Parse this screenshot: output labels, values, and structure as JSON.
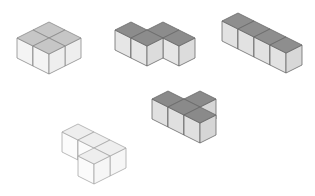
{
  "diagram": {
    "title": "",
    "width": 315,
    "height": 196,
    "background": "#ffffff",
    "geometry": {
      "axis_a": [
        16,
        8
      ],
      "axis_b": [
        16,
        -8
      ],
      "cube_height": 20
    },
    "shapes": [
      {
        "name": "square-2x2-block",
        "origin": [
          17,
          38
        ],
        "cells": [
          [
            0,
            0
          ],
          [
            1,
            0
          ],
          [
            0,
            1
          ],
          [
            1,
            1
          ]
        ],
        "top_color": "#c6c6c6",
        "left_color": "#f4f4f4",
        "right_color": "#eeeeee",
        "line_color": "#8a8a8a"
      },
      {
        "name": "s-tetromino",
        "origin": [
          115,
          30
        ],
        "cells": [
          [
            0,
            0
          ],
          [
            1,
            0
          ],
          [
            1,
            1
          ],
          [
            2,
            1
          ]
        ],
        "top_color": "#8c8c8c",
        "left_color": "#e6e6e6",
        "right_color": "#dcdcdc",
        "line_color": "#6a6a6a"
      },
      {
        "name": "i-tetromino-bar",
        "origin": [
          222,
          21
        ],
        "cells": [
          [
            0,
            0
          ],
          [
            1,
            0
          ],
          [
            2,
            0
          ],
          [
            3,
            0
          ]
        ],
        "top_color": "#8e8e8e",
        "left_color": "#e2e2e2",
        "right_color": "#d8d8d8",
        "line_color": "#6a6a6a"
      },
      {
        "name": "t-tetromino",
        "origin": [
          152,
          99
        ],
        "cells": [
          [
            0,
            0
          ],
          [
            1,
            0
          ],
          [
            2,
            0
          ],
          [
            1,
            1
          ]
        ],
        "top_color": "#8a8a8a",
        "left_color": "#e0e0e0",
        "right_color": "#d6d6d6",
        "line_color": "#686868"
      },
      {
        "name": "l-tetromino-outline",
        "origin": [
          46,
          140
        ],
        "cells": [
          [
            0,
            1
          ],
          [
            1,
            1
          ],
          [
            2,
            1
          ],
          [
            2,
            0
          ]
        ],
        "top_color": "#eeeeee",
        "left_color": "#fbfbfb",
        "right_color": "#f6f6f6",
        "line_color": "#a8a8a8"
      }
    ]
  }
}
